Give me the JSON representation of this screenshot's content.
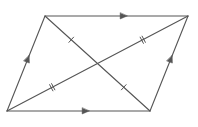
{
  "diagram": {
    "type": "parallelogram-with-diagonals",
    "stroke_color": "#555555",
    "background": "#ffffff",
    "vertices": {
      "bottom_left": [
        7,
        111
      ],
      "bottom_right": [
        150,
        111
      ],
      "top_right": [
        188,
        16
      ],
      "top_left": [
        45,
        16
      ]
    },
    "sides": [
      {
        "name": "bottom",
        "from": "bottom_left",
        "to": "bottom_right",
        "marking": "single-arrow",
        "arrow_direction": "right"
      },
      {
        "name": "top",
        "from": "top_left",
        "to": "top_right",
        "marking": "single-arrow",
        "arrow_direction": "right"
      },
      {
        "name": "left",
        "from": "bottom_left",
        "to": "top_left",
        "marking": "single-arrow",
        "arrow_direction": "up"
      },
      {
        "name": "right",
        "from": "bottom_right",
        "to": "top_right",
        "marking": "single-arrow",
        "arrow_direction": "up"
      }
    ],
    "diagonals": [
      {
        "name": "diagonal-top-left-to-bottom-right",
        "from": "top_left",
        "to": "bottom_right",
        "marking": "single-tick-each-half"
      },
      {
        "name": "diagonal-bottom-left-to-top-right",
        "from": "bottom_left",
        "to": "top_right",
        "marking": "double-tick-each-half"
      }
    ],
    "intersection": [
      97.5,
      63.5
    ],
    "meaning": {
      "parallel_arrows": "opposite sides are parallel",
      "tick_marks": "diagonals bisect each other"
    }
  }
}
